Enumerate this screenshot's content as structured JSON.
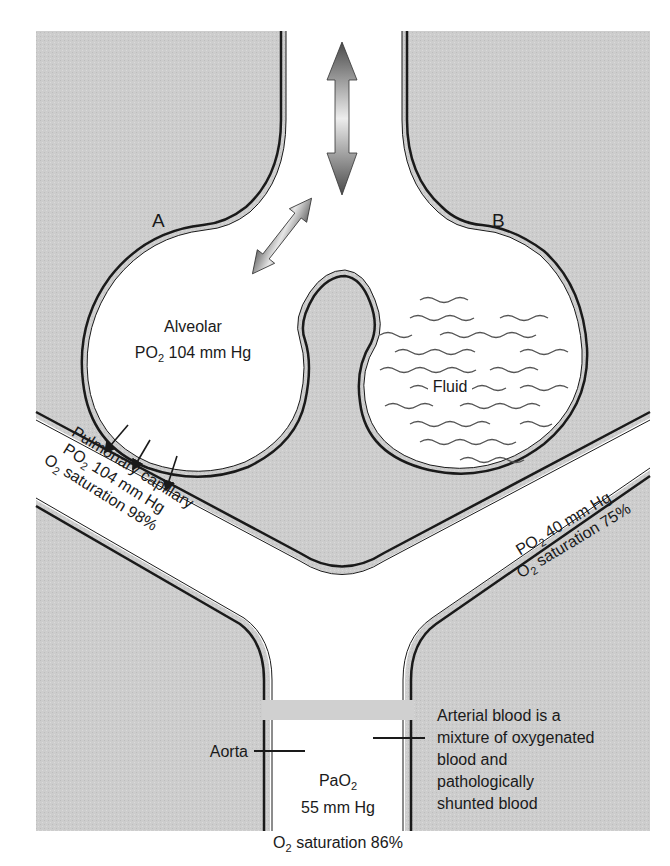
{
  "diagram": {
    "colors": {
      "tissue": "#cfcfcf",
      "lumen": "#ffffff",
      "wall": "#1a1a1a",
      "arrow_dark": "#4a4a4a",
      "arrow_light": "#e8e8e8",
      "fluid_wave": "#555555"
    },
    "labels": {
      "alveolus_a": "A",
      "alveolus_b": "B",
      "alveolar_line1": "Alveolar",
      "alveolar_po2_prefix": "PO",
      "alveolar_po2_sub": "2",
      "alveolar_po2_value": " 104 mm Hg",
      "fluid": "Fluid",
      "capillary_a_line1": "Pulmonary capillary",
      "capillary_a_po2_prefix": "PO",
      "capillary_a_po2_sub": "2",
      "capillary_a_po2_value": " 104 mm Hg",
      "capillary_a_sat_prefix": "O",
      "capillary_a_sat_sub": "2",
      "capillary_a_sat_value": " saturation 98%",
      "capillary_b_po2_prefix": "PO",
      "capillary_b_po2_sub": "2",
      "capillary_b_po2_value": " 40 mm Hg",
      "capillary_b_sat_prefix": "O",
      "capillary_b_sat_sub": "2",
      "capillary_b_sat_value": " saturation 75%",
      "aorta": "Aorta",
      "pao2_prefix": "PaO",
      "pao2_sub": "2",
      "pao2_value": "55 mm Hg",
      "arterial_sat_prefix": "O",
      "arterial_sat_sub": "2",
      "arterial_sat_value": " saturation 86%",
      "arterial_note": [
        "Arterial blood is a",
        "mixture of oxygenated",
        "blood and",
        "pathologically",
        "shunted blood"
      ]
    },
    "icons": {
      "ventilation_arrow": "double-headed-vertical-arrow",
      "alveolar_ventilation_arrow": "double-headed-diagonal-arrow",
      "diffusion_arrows": "small-diagonal-arrows-x3"
    }
  }
}
